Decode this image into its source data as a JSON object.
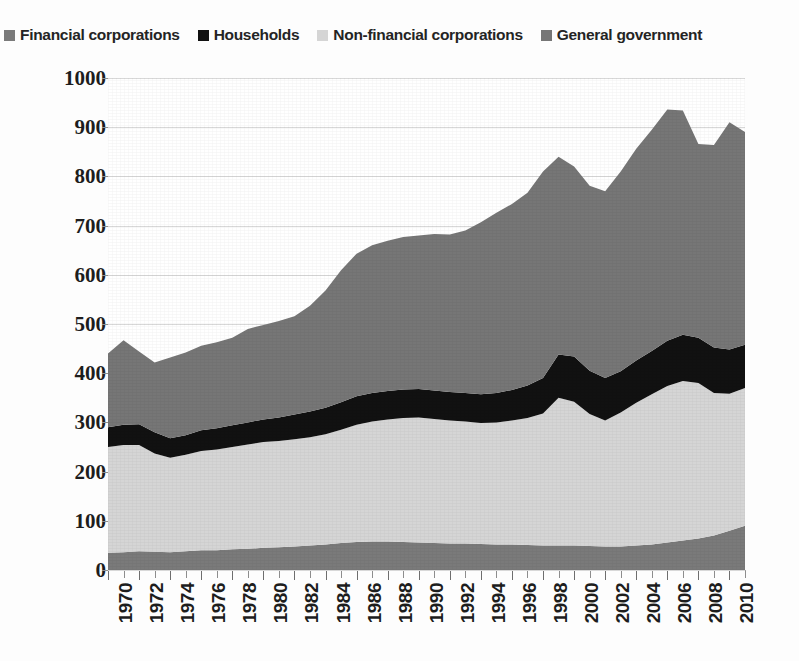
{
  "legend": {
    "position": "top-left",
    "items": [
      {
        "label": "Financial corporations",
        "color": "#7a7a7a",
        "icon": "square-swatch-icon"
      },
      {
        "label": "Households",
        "color": "#111111",
        "icon": "square-swatch-icon"
      },
      {
        "label": "Non-financial corporations",
        "color": "#d5d5d5",
        "icon": "square-swatch-icon"
      },
      {
        "label": "General government",
        "color": "#767676",
        "icon": "square-swatch-icon"
      }
    ]
  },
  "axes": {
    "y_ticks": [
      "1000",
      "900",
      "800",
      "700",
      "600",
      "500",
      "400",
      "300",
      "200",
      "100",
      "0"
    ],
    "x_ticks": [
      "1970",
      "1972",
      "1974",
      "1976",
      "1978",
      "1980",
      "1982",
      "1984",
      "1986",
      "1988",
      "1990",
      "1992",
      "1994",
      "1996",
      "1998",
      "2000",
      "2002",
      "2004",
      "2006",
      "2008",
      "2010"
    ]
  },
  "chart_data": {
    "type": "area",
    "stacked": true,
    "title": "",
    "xlabel": "",
    "ylabel": "",
    "ylim": [
      0,
      1000
    ],
    "ytick_step": 100,
    "grid": true,
    "legend_position": "top-left",
    "stack_order_bottom_to_top": [
      "Financial corporations",
      "Non-financial corporations",
      "Households",
      "General government"
    ],
    "x": [
      1970,
      1971,
      1972,
      1973,
      1974,
      1975,
      1976,
      1977,
      1978,
      1979,
      1980,
      1981,
      1982,
      1983,
      1984,
      1985,
      1986,
      1987,
      1988,
      1989,
      1990,
      1991,
      1992,
      1993,
      1994,
      1995,
      1996,
      1997,
      1998,
      1999,
      2000,
      2001,
      2002,
      2003,
      2004,
      2005,
      2006,
      2007,
      2008,
      2009,
      2010,
      2011
    ],
    "series": [
      {
        "name": "Financial corporations",
        "color": "#7a7a7a",
        "values": [
          35,
          36,
          38,
          37,
          36,
          38,
          40,
          40,
          42,
          43,
          45,
          46,
          48,
          50,
          52,
          55,
          57,
          58,
          58,
          57,
          56,
          55,
          54,
          54,
          53,
          52,
          52,
          51,
          50,
          50,
          50,
          49,
          48,
          48,
          50,
          52,
          56,
          60,
          64,
          70,
          80,
          90
        ]
      },
      {
        "name": "Non-financial corporations",
        "color": "#d5d5d5",
        "values": [
          215,
          218,
          216,
          200,
          192,
          196,
          202,
          205,
          208,
          212,
          215,
          216,
          218,
          220,
          224,
          230,
          238,
          244,
          248,
          252,
          254,
          252,
          250,
          248,
          246,
          248,
          252,
          258,
          268,
          300,
          292,
          268,
          256,
          272,
          290,
          305,
          318,
          324,
          316,
          290,
          278,
          280
        ]
      },
      {
        "name": "Households",
        "color": "#111111",
        "values": [
          40,
          41,
          42,
          43,
          40,
          40,
          42,
          43,
          44,
          45,
          46,
          48,
          50,
          52,
          54,
          56,
          58,
          58,
          58,
          58,
          58,
          58,
          58,
          58,
          58,
          60,
          62,
          66,
          72,
          88,
          92,
          88,
          86,
          84,
          86,
          88,
          92,
          94,
          92,
          92,
          90,
          88
        ]
      },
      {
        "name": "General government",
        "color": "#767676",
        "values": [
          150,
          172,
          148,
          142,
          164,
          168,
          172,
          175,
          178,
          190,
          192,
          196,
          200,
          215,
          238,
          268,
          290,
          300,
          305,
          310,
          312,
          318,
          320,
          330,
          350,
          366,
          378,
          392,
          420,
          402,
          386,
          376,
          380,
          406,
          430,
          450,
          470,
          456,
          394,
          412,
          462,
          432
        ]
      }
    ],
    "totals": [
      440,
      467,
      444,
      422,
      432,
      442,
      456,
      463,
      472,
      490,
      498,
      506,
      516,
      537,
      568,
      609,
      643,
      660,
      669,
      677,
      680,
      683,
      682,
      690,
      707,
      726,
      744,
      767,
      810,
      840,
      820,
      781,
      770,
      810,
      856,
      895,
      936,
      934,
      866,
      864,
      910,
      890
    ]
  }
}
